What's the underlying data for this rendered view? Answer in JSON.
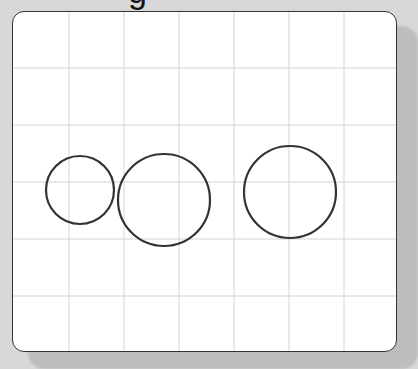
{
  "title": {
    "visible_fragment": "g"
  },
  "board": {
    "background": "#ffffff",
    "border_color": "#333333",
    "grid_color": "#d4d4d4",
    "grid": {
      "vertical_x": [
        56,
        111,
        166,
        221,
        276,
        331
      ],
      "horizontal_y": [
        56,
        113,
        170,
        227,
        284
      ]
    },
    "circles": [
      {
        "id": "circle-1",
        "cx": 67,
        "cy": 178,
        "r": 34,
        "stroke": "#333333"
      },
      {
        "id": "circle-2",
        "cx": 151,
        "cy": 188,
        "r": 46,
        "stroke": "#333333"
      },
      {
        "id": "circle-3",
        "cx": 277,
        "cy": 180,
        "r": 46,
        "stroke": "#333333"
      }
    ]
  }
}
